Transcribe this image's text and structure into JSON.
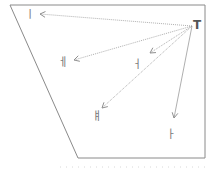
{
  "diagram": {
    "source": {
      "id": "source",
      "label": "T"
    },
    "targets": [
      {
        "id": "t1",
        "label": "ㅣ",
        "style": "dotted"
      },
      {
        "id": "t2",
        "label": "ㅔ",
        "style": "dotted"
      },
      {
        "id": "t3",
        "label": "ㅓ",
        "style": "dotted"
      },
      {
        "id": "t4",
        "label": "ㅒ",
        "style": "dotted"
      },
      {
        "id": "t5",
        "label": "ㅏ",
        "style": "solid"
      }
    ]
  },
  "colors": {
    "frame": "#8a8a8a",
    "arrow": "#9a9a9a",
    "text": "#7a7a7a"
  }
}
